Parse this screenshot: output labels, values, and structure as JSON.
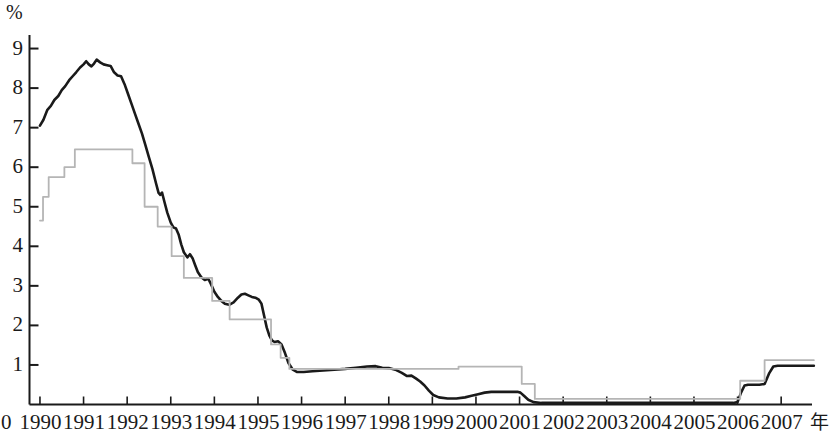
{
  "chart_data": {
    "type": "line",
    "title": "",
    "xlabel": "年",
    "ylabel": "%",
    "grid": false,
    "legend": "none",
    "xlim": [
      1989.75,
      2007.9
    ],
    "ylim": [
      0,
      9.35
    ],
    "y_ticks": [
      1,
      2,
      3,
      4,
      5,
      6,
      7,
      8,
      9
    ],
    "y_tick_labels": [
      "1",
      "2",
      "3",
      "4",
      "5",
      "6",
      "7",
      "8",
      "9"
    ],
    "origin_label": "0",
    "x_ticks": [
      1990,
      1991,
      1992,
      1993,
      1994,
      1995,
      1996,
      1997,
      1998,
      1999,
      2000,
      2001,
      2002,
      2003,
      2004,
      2005,
      2006,
      2007
    ],
    "x_tick_labels": [
      "1990",
      "1991",
      "1992",
      "1993",
      "1994",
      "1995",
      "1996",
      "1997",
      "1998",
      "1999",
      "2000",
      "2001",
      "2002",
      "2003",
      "2004",
      "2005",
      "2006",
      "2007"
    ],
    "series": [
      {
        "name": "market-rate-line",
        "style": "solid",
        "color": "#1a1a1a",
        "width": 2.6,
        "points": [
          [
            1990.0,
            7.05
          ],
          [
            1990.08,
            7.2
          ],
          [
            1990.17,
            7.45
          ],
          [
            1990.25,
            7.55
          ],
          [
            1990.33,
            7.7
          ],
          [
            1990.42,
            7.8
          ],
          [
            1990.5,
            7.95
          ],
          [
            1990.58,
            8.05
          ],
          [
            1990.67,
            8.2
          ],
          [
            1990.75,
            8.3
          ],
          [
            1990.83,
            8.4
          ],
          [
            1990.92,
            8.52
          ],
          [
            1991.0,
            8.6
          ],
          [
            1991.06,
            8.68
          ],
          [
            1991.12,
            8.6
          ],
          [
            1991.18,
            8.55
          ],
          [
            1991.24,
            8.62
          ],
          [
            1991.3,
            8.72
          ],
          [
            1991.38,
            8.65
          ],
          [
            1991.46,
            8.6
          ],
          [
            1991.54,
            8.58
          ],
          [
            1991.62,
            8.56
          ],
          [
            1991.7,
            8.4
          ],
          [
            1991.78,
            8.32
          ],
          [
            1991.86,
            8.3
          ],
          [
            1991.94,
            8.1
          ],
          [
            1992.02,
            7.85
          ],
          [
            1992.1,
            7.6
          ],
          [
            1992.18,
            7.35
          ],
          [
            1992.26,
            7.1
          ],
          [
            1992.34,
            6.85
          ],
          [
            1992.42,
            6.55
          ],
          [
            1992.5,
            6.25
          ],
          [
            1992.58,
            5.95
          ],
          [
            1992.66,
            5.6
          ],
          [
            1992.72,
            5.35
          ],
          [
            1992.76,
            5.3
          ],
          [
            1992.8,
            5.36
          ],
          [
            1992.86,
            5.1
          ],
          [
            1992.92,
            4.85
          ],
          [
            1993.0,
            4.6
          ],
          [
            1993.06,
            4.48
          ],
          [
            1993.12,
            4.45
          ],
          [
            1993.18,
            4.3
          ],
          [
            1993.24,
            4.05
          ],
          [
            1993.3,
            3.85
          ],
          [
            1993.38,
            3.72
          ],
          [
            1993.44,
            3.8
          ],
          [
            1993.5,
            3.7
          ],
          [
            1993.56,
            3.52
          ],
          [
            1993.62,
            3.35
          ],
          [
            1993.7,
            3.22
          ],
          [
            1993.78,
            3.15
          ],
          [
            1993.86,
            3.18
          ],
          [
            1993.92,
            3.05
          ],
          [
            1994.0,
            2.85
          ],
          [
            1994.08,
            2.72
          ],
          [
            1994.16,
            2.62
          ],
          [
            1994.24,
            2.55
          ],
          [
            1994.34,
            2.52
          ],
          [
            1994.44,
            2.58
          ],
          [
            1994.54,
            2.7
          ],
          [
            1994.62,
            2.78
          ],
          [
            1994.7,
            2.8
          ],
          [
            1994.78,
            2.76
          ],
          [
            1994.86,
            2.72
          ],
          [
            1994.94,
            2.7
          ],
          [
            1995.02,
            2.65
          ],
          [
            1995.08,
            2.55
          ],
          [
            1995.14,
            2.25
          ],
          [
            1995.2,
            1.95
          ],
          [
            1995.26,
            1.75
          ],
          [
            1995.32,
            1.62
          ],
          [
            1995.38,
            1.58
          ],
          [
            1995.46,
            1.6
          ],
          [
            1995.54,
            1.52
          ],
          [
            1995.62,
            1.3
          ],
          [
            1995.7,
            1.05
          ],
          [
            1995.8,
            0.88
          ],
          [
            1995.9,
            0.82
          ],
          [
            1996.05,
            0.82
          ],
          [
            1996.25,
            0.84
          ],
          [
            1996.5,
            0.86
          ],
          [
            1996.75,
            0.88
          ],
          [
            1997.0,
            0.9
          ],
          [
            1997.25,
            0.93
          ],
          [
            1997.5,
            0.96
          ],
          [
            1997.7,
            0.97
          ],
          [
            1997.85,
            0.93
          ],
          [
            1998.0,
            0.92
          ],
          [
            1998.15,
            0.88
          ],
          [
            1998.3,
            0.8
          ],
          [
            1998.42,
            0.72
          ],
          [
            1998.52,
            0.73
          ],
          [
            1998.62,
            0.66
          ],
          [
            1998.72,
            0.58
          ],
          [
            1998.82,
            0.48
          ],
          [
            1998.92,
            0.35
          ],
          [
            1999.02,
            0.24
          ],
          [
            1999.15,
            0.18
          ],
          [
            1999.35,
            0.15
          ],
          [
            1999.55,
            0.15
          ],
          [
            1999.75,
            0.18
          ],
          [
            1999.9,
            0.22
          ],
          [
            2000.05,
            0.26
          ],
          [
            2000.2,
            0.3
          ],
          [
            2000.35,
            0.32
          ],
          [
            2000.5,
            0.32
          ],
          [
            2000.65,
            0.32
          ],
          [
            2000.8,
            0.32
          ],
          [
            2000.95,
            0.32
          ],
          [
            2001.02,
            0.3
          ],
          [
            2001.1,
            0.22
          ],
          [
            2001.2,
            0.12
          ],
          [
            2001.32,
            0.06
          ],
          [
            2001.5,
            0.04
          ],
          [
            2002.0,
            0.04
          ],
          [
            2002.5,
            0.04
          ],
          [
            2003.0,
            0.04
          ],
          [
            2003.5,
            0.04
          ],
          [
            2004.0,
            0.04
          ],
          [
            2004.5,
            0.04
          ],
          [
            2005.0,
            0.04
          ],
          [
            2005.5,
            0.04
          ],
          [
            2005.9,
            0.04
          ],
          [
            2006.0,
            0.06
          ],
          [
            2006.08,
            0.3
          ],
          [
            2006.16,
            0.48
          ],
          [
            2006.24,
            0.5
          ],
          [
            2006.5,
            0.5
          ],
          [
            2006.62,
            0.52
          ],
          [
            2006.72,
            0.78
          ],
          [
            2006.82,
            0.96
          ],
          [
            2006.92,
            0.98
          ],
          [
            2007.1,
            0.98
          ],
          [
            2007.4,
            0.98
          ],
          [
            2007.75,
            0.98
          ]
        ]
      },
      {
        "name": "policy-rate-step-line",
        "style": "step",
        "color": "#b5b5b5",
        "width": 1.8,
        "points": [
          [
            1990.0,
            4.65
          ],
          [
            1990.07,
            4.65
          ],
          [
            1990.07,
            5.25
          ],
          [
            1990.2,
            5.25
          ],
          [
            1990.2,
            5.75
          ],
          [
            1990.56,
            5.75
          ],
          [
            1990.56,
            6.0
          ],
          [
            1990.8,
            6.0
          ],
          [
            1990.8,
            6.45
          ],
          [
            1992.12,
            6.45
          ],
          [
            1992.12,
            6.1
          ],
          [
            1992.4,
            6.1
          ],
          [
            1992.4,
            5.0
          ],
          [
            1992.7,
            5.0
          ],
          [
            1992.7,
            4.5
          ],
          [
            1993.02,
            4.5
          ],
          [
            1993.02,
            3.75
          ],
          [
            1993.3,
            3.75
          ],
          [
            1993.3,
            3.2
          ],
          [
            1993.95,
            3.2
          ],
          [
            1993.95,
            2.62
          ],
          [
            1994.35,
            2.62
          ],
          [
            1994.35,
            2.15
          ],
          [
            1995.18,
            2.15
          ],
          [
            1995.18,
            2.15
          ],
          [
            1995.3,
            2.15
          ],
          [
            1995.3,
            1.52
          ],
          [
            1995.52,
            1.52
          ],
          [
            1995.52,
            1.18
          ],
          [
            1995.72,
            1.18
          ],
          [
            1995.72,
            0.9
          ],
          [
            1999.6,
            0.9
          ],
          [
            1999.6,
            0.96
          ],
          [
            2001.05,
            0.96
          ],
          [
            2001.05,
            0.52
          ],
          [
            2001.35,
            0.52
          ],
          [
            2001.35,
            0.14
          ],
          [
            2006.06,
            0.14
          ],
          [
            2006.06,
            0.6
          ],
          [
            2006.62,
            0.6
          ],
          [
            2006.62,
            1.12
          ],
          [
            2007.75,
            1.12
          ]
        ]
      }
    ]
  }
}
